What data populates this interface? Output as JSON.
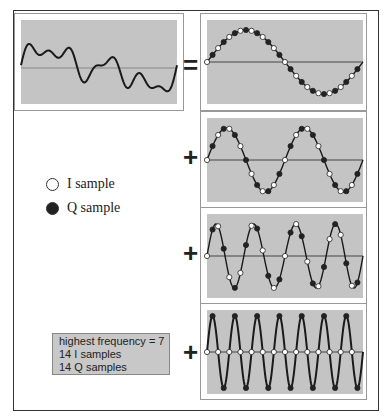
{
  "diagram": {
    "title": "",
    "operators": {
      "equals": "=",
      "plus": "+"
    },
    "legend": {
      "i_sample": {
        "label": "I sample",
        "fill": "#ffffff"
      },
      "q_sample": {
        "label": "Q sample",
        "fill": "#222222"
      }
    },
    "info_box": {
      "line1": "highest frequency = 7",
      "line2": "14 I samples",
      "line3": "14 Q samples"
    },
    "panels": [
      {
        "name": "source-signal",
        "description": "composite waveform"
      },
      {
        "name": "component-1",
        "frequency": 1,
        "samples": "alternating I/Q dots"
      },
      {
        "name": "component-2",
        "frequency": 2,
        "samples": "alternating I/Q dots"
      },
      {
        "name": "component-3",
        "frequency": 4,
        "samples": "alternating I/Q dots"
      },
      {
        "name": "component-4",
        "frequency": 7,
        "samples": "I on axis, Q at peaks"
      }
    ],
    "colors": {
      "panel_bg": "#c4c4c4",
      "line": "#222222",
      "axis": "#555555"
    }
  }
}
